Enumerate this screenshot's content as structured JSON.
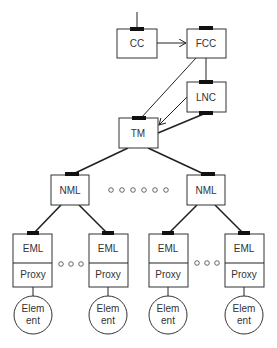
{
  "diagram": {
    "title": "",
    "nodes": {
      "cc": {
        "label": "CC"
      },
      "fcc": {
        "label": "FCC"
      },
      "lnc": {
        "label": "LNC"
      },
      "tm": {
        "label": "TM"
      },
      "nml_left": {
        "label": "NML"
      },
      "nml_right": {
        "label": "NML"
      },
      "eml": [
        {
          "top": "EML",
          "bottom": "Proxy"
        },
        {
          "top": "EML",
          "bottom": "Proxy"
        },
        {
          "top": "EML",
          "bottom": "Proxy"
        },
        {
          "top": "EML",
          "bottom": "Proxy"
        }
      ],
      "element": [
        {
          "line1": "Elem",
          "line2": "ent"
        },
        {
          "line1": "Elem",
          "line2": "ent"
        },
        {
          "line1": "Elem",
          "line2": "ent"
        },
        {
          "line1": "Elem",
          "line2": "ent"
        }
      ]
    },
    "edges": [
      {
        "from": "external",
        "to": "CC",
        "type": "line"
      },
      {
        "from": "CC",
        "to": "FCC",
        "type": "arrow"
      },
      {
        "from": "FCC",
        "to": "LNC",
        "type": "line"
      },
      {
        "from": "FCC",
        "to": "TM",
        "type": "line"
      },
      {
        "from": "LNC",
        "to": "TM",
        "type": "arrow"
      },
      {
        "from": "LNC",
        "to": "TM",
        "type": "bold-line"
      },
      {
        "from": "TM",
        "to": "NML (left)",
        "type": "bold-line"
      },
      {
        "from": "TM",
        "to": "NML (right)",
        "type": "bold-line"
      },
      {
        "from": "NML (left)",
        "to": "EML 1",
        "type": "bold-line"
      },
      {
        "from": "NML (left)",
        "to": "EML 2",
        "type": "bold-line"
      },
      {
        "from": "NML (right)",
        "to": "EML 3",
        "type": "bold-line"
      },
      {
        "from": "NML (right)",
        "to": "EML 4",
        "type": "bold-line"
      },
      {
        "from": "Proxy",
        "to": "Element",
        "type": "line"
      }
    ],
    "ellipsis": {
      "between_nml": 6,
      "between_eml": 3
    }
  }
}
